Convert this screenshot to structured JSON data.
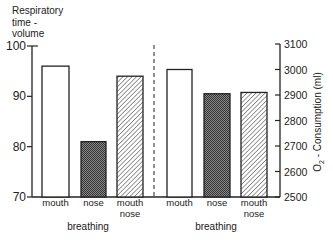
{
  "chart_data": [
    {
      "type": "bar",
      "title": "",
      "ylabel": "Respiratory time - volume",
      "ylabel_lines": [
        "Respiratory",
        "time -",
        "volume"
      ],
      "xlabel": "breathing",
      "categories": [
        "mouth",
        "nose",
        "mouth nose"
      ],
      "values": [
        96,
        81,
        94
      ],
      "ylim": [
        70,
        100
      ],
      "yticks": [
        70,
        80,
        90,
        100
      ],
      "axis_side": "left",
      "fills": [
        "white",
        "dark-checkered",
        "diagonal-hatch"
      ],
      "grid": false
    },
    {
      "type": "bar",
      "title": "",
      "ylabel": "O2 - Consumption (ml)",
      "xlabel": "breathing",
      "categories": [
        "mouth",
        "nose",
        "mouth nose"
      ],
      "values": [
        3000,
        2905,
        2910
      ],
      "ylim": [
        2500,
        3100
      ],
      "yticks": [
        2500,
        2600,
        2700,
        2800,
        2900,
        3000,
        3100
      ],
      "axis_side": "right",
      "fills": [
        "white",
        "dark-checkered",
        "diagonal-hatch"
      ],
      "grid": false
    }
  ],
  "labels": {
    "left_ylabel": [
      "Respiratory",
      "time -",
      "volume"
    ],
    "right_ylabel_main": "O",
    "right_ylabel_sub": "2",
    "right_ylabel_rest": " - Consumption  (ml)",
    "xlabel": "breathing"
  },
  "colors": {
    "ink": "#222222",
    "nose_dark": "#3a3a3a",
    "nose_light": "#8a8a8a",
    "background": "#ffffff"
  }
}
